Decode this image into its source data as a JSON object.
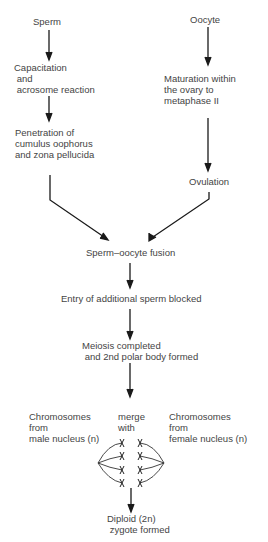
{
  "diagram": {
    "left_branch": {
      "start": "Sperm",
      "step1": "Capacitation\n and\n acrosome reaction",
      "step2": "Penetration of\ncumulus oophorus\nand zona pellucida"
    },
    "right_branch": {
      "start": "Oocyte",
      "step1": "Maturation within\nthe ovary to\nmetaphase II",
      "step2": "Ovulation"
    },
    "merged": {
      "fusion": "Sperm–oocyte fusion",
      "block": "Entry of additional sperm blocked",
      "meiosis": "Meiosis completed\n and 2nd polar body formed"
    },
    "chromosomes": {
      "male": "Chromosomes\nfrom\nmale nucleus (n)",
      "merge": "merge\nwith",
      "female": "Chromosomes\nfrom\nfemale nucleus (n)"
    },
    "result": "Diploid (2n)\n zygote formed",
    "colors": {
      "line": "#1a1a1a",
      "text": "#444444",
      "background": "#ffffff"
    }
  }
}
